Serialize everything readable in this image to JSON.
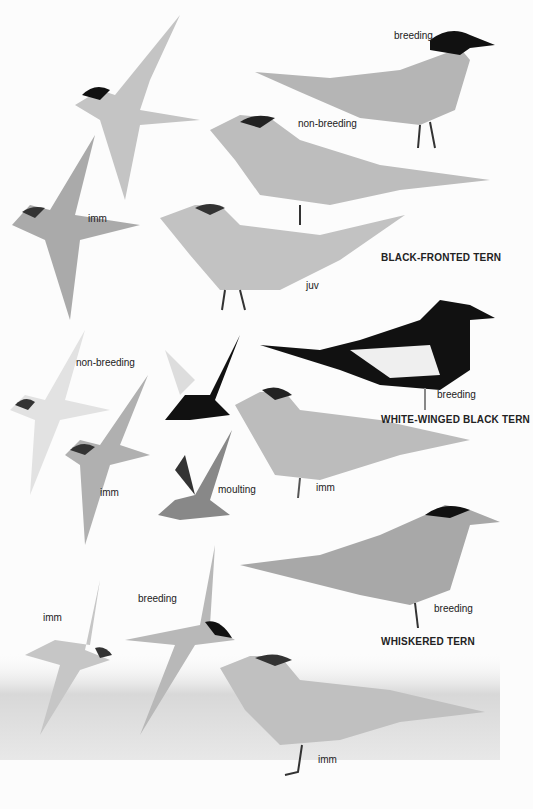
{
  "plate": {
    "species": [
      {
        "name": "BLACK-FRONTED TERN",
        "labels": [
          "breeding",
          "non-breeding",
          "imm",
          "juv"
        ]
      },
      {
        "name": "WHITE-WINGED BLACK TERN",
        "labels": [
          "non-breeding",
          "imm",
          "moulting",
          "breeding",
          "imm"
        ]
      },
      {
        "name": "WHISKERED TERN",
        "labels": [
          "breeding",
          "imm",
          "breeding",
          "imm"
        ]
      }
    ]
  }
}
